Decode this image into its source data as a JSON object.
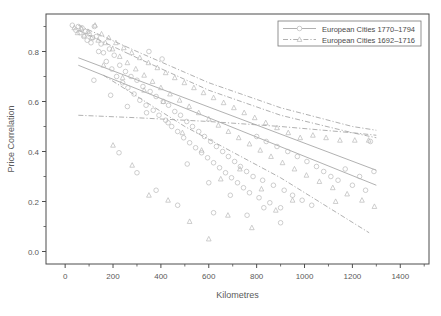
{
  "chart_data": {
    "type": "scatter",
    "title": "",
    "xlabel": "Kilometres",
    "ylabel": "Price Correlation",
    "xlim": [
      -80,
      1520
    ],
    "ylim": [
      -0.05,
      0.95
    ],
    "xticks": [
      0,
      200,
      400,
      600,
      800,
      1000,
      1200,
      1400
    ],
    "xtick_labels": [
      "0",
      "200",
      "400",
      "600",
      "800",
      "1000",
      "1200",
      "1400"
    ],
    "yticks": [
      0.0,
      0.2,
      0.4,
      0.6,
      0.8
    ],
    "ytick_labels": [
      "0.0",
      "0.2",
      "0.4",
      "0.6",
      "0.8"
    ],
    "minor_ticks": true,
    "grid": false,
    "legend_position": "top-right",
    "marker_color": "#b9b9b9",
    "line_color": "#a8a8a8",
    "frame_color": "#4d4d4d",
    "series": [
      {
        "name": "European Cities 1770–1794",
        "marker": "circle",
        "linestyle": "solid",
        "points": [
          [
            30,
            0.905
          ],
          [
            45,
            0.885
          ],
          [
            55,
            0.9
          ],
          [
            62,
            0.875
          ],
          [
            70,
            0.895
          ],
          [
            78,
            0.86
          ],
          [
            85,
            0.88
          ],
          [
            92,
            0.845
          ],
          [
            100,
            0.87
          ],
          [
            108,
            0.835
          ],
          [
            115,
            0.855
          ],
          [
            122,
            0.9
          ],
          [
            130,
            0.86
          ],
          [
            140,
            0.8
          ],
          [
            150,
            0.83
          ],
          [
            160,
            0.795
          ],
          [
            172,
            0.76
          ],
          [
            185,
            0.81
          ],
          [
            195,
            0.73
          ],
          [
            205,
            0.785
          ],
          [
            215,
            0.7
          ],
          [
            228,
            0.745
          ],
          [
            240,
            0.675
          ],
          [
            252,
            0.72
          ],
          [
            262,
            0.655
          ],
          [
            275,
            0.7
          ],
          [
            288,
            0.63
          ],
          [
            300,
            0.685
          ],
          [
            312,
            0.605
          ],
          [
            325,
            0.66
          ],
          [
            338,
            0.585
          ],
          [
            350,
            0.8
          ],
          [
            355,
            0.64
          ],
          [
            368,
            0.565
          ],
          [
            380,
            0.62
          ],
          [
            392,
            0.545
          ],
          [
            405,
            0.77
          ],
          [
            410,
            0.6
          ],
          [
            420,
            0.525
          ],
          [
            432,
            0.585
          ],
          [
            445,
            0.5
          ],
          [
            458,
            0.56
          ],
          [
            470,
            0.48
          ],
          [
            482,
            0.545
          ],
          [
            495,
            0.455
          ],
          [
            508,
            0.52
          ],
          [
            520,
            0.435
          ],
          [
            532,
            0.5
          ],
          [
            545,
            0.415
          ],
          [
            558,
            0.48
          ],
          [
            570,
            0.395
          ],
          [
            582,
            0.46
          ],
          [
            595,
            0.375
          ],
          [
            608,
            0.44
          ],
          [
            620,
            0.355
          ],
          [
            632,
            0.42
          ],
          [
            645,
            0.335
          ],
          [
            658,
            0.4
          ],
          [
            670,
            0.315
          ],
          [
            682,
            0.38
          ],
          [
            695,
            0.295
          ],
          [
            708,
            0.36
          ],
          [
            720,
            0.275
          ],
          [
            732,
            0.34
          ],
          [
            745,
            0.255
          ],
          [
            758,
            0.32
          ],
          [
            770,
            0.235
          ],
          [
            785,
            0.3
          ],
          [
            800,
            0.46
          ],
          [
            810,
            0.215
          ],
          [
            825,
            0.285
          ],
          [
            840,
            0.44
          ],
          [
            855,
            0.195
          ],
          [
            870,
            0.265
          ],
          [
            885,
            0.42
          ],
          [
            900,
            0.175
          ],
          [
            915,
            0.245
          ],
          [
            930,
            0.4
          ],
          [
            950,
            0.225
          ],
          [
            970,
            0.38
          ],
          [
            990,
            0.205
          ],
          [
            1010,
            0.36
          ],
          [
            1030,
            0.185
          ],
          [
            1050,
            0.34
          ],
          [
            1080,
            0.32
          ],
          [
            1110,
            0.3
          ],
          [
            1140,
            0.285
          ],
          [
            1170,
            0.33
          ],
          [
            1200,
            0.265
          ],
          [
            1230,
            0.3
          ],
          [
            1255,
            0.245
          ],
          [
            1275,
            0.44
          ],
          [
            1290,
            0.32
          ],
          [
            120,
            0.685
          ],
          [
            190,
            0.625
          ],
          [
            260,
            0.58
          ],
          [
            340,
            0.555
          ],
          [
            430,
            0.515
          ],
          [
            510,
            0.35
          ],
          [
            600,
            0.275
          ],
          [
            690,
            0.225
          ],
          [
            760,
            0.145
          ],
          [
            830,
            0.175
          ],
          [
            900,
            0.115
          ],
          [
            620,
            0.155
          ],
          [
            470,
            0.185
          ],
          [
            380,
            0.245
          ],
          [
            300,
            0.315
          ],
          [
            225,
            0.395
          ]
        ]
      },
      {
        "name": "European Cities 1692–1716",
        "marker": "triangle",
        "linestyle": "dashdot",
        "points": [
          [
            38,
            0.895
          ],
          [
            52,
            0.875
          ],
          [
            68,
            0.89
          ],
          [
            80,
            0.865
          ],
          [
            95,
            0.88
          ],
          [
            110,
            0.855
          ],
          [
            125,
            0.905
          ],
          [
            138,
            0.845
          ],
          [
            152,
            0.87
          ],
          [
            168,
            0.835
          ],
          [
            182,
            0.855
          ],
          [
            198,
            0.81
          ],
          [
            212,
            0.835
          ],
          [
            228,
            0.78
          ],
          [
            245,
            0.815
          ],
          [
            260,
            0.755
          ],
          [
            278,
            0.795
          ],
          [
            295,
            0.73
          ],
          [
            312,
            0.775
          ],
          [
            330,
            0.705
          ],
          [
            348,
            0.755
          ],
          [
            365,
            0.68
          ],
          [
            385,
            0.735
          ],
          [
            400,
            0.655
          ],
          [
            420,
            0.715
          ],
          [
            438,
            0.63
          ],
          [
            458,
            0.695
          ],
          [
            478,
            0.605
          ],
          [
            498,
            0.675
          ],
          [
            518,
            0.58
          ],
          [
            538,
            0.655
          ],
          [
            558,
            0.555
          ],
          [
            578,
            0.635
          ],
          [
            600,
            0.53
          ],
          [
            620,
            0.615
          ],
          [
            640,
            0.505
          ],
          [
            662,
            0.595
          ],
          [
            682,
            0.48
          ],
          [
            705,
            0.575
          ],
          [
            725,
            0.455
          ],
          [
            748,
            0.555
          ],
          [
            770,
            0.43
          ],
          [
            792,
            0.535
          ],
          [
            815,
            0.405
          ],
          [
            838,
            0.515
          ],
          [
            860,
            0.38
          ],
          [
            885,
            0.495
          ],
          [
            908,
            0.355
          ],
          [
            932,
            0.475
          ],
          [
            958,
            0.33
          ],
          [
            982,
            0.455
          ],
          [
            1008,
            0.305
          ],
          [
            1035,
            0.465
          ],
          [
            1062,
            0.28
          ],
          [
            1090,
            0.455
          ],
          [
            1118,
            0.255
          ],
          [
            1148,
            0.445
          ],
          [
            1178,
            0.23
          ],
          [
            1210,
            0.445
          ],
          [
            1240,
            0.205
          ],
          [
            1268,
            0.445
          ],
          [
            1292,
            0.18
          ],
          [
            160,
            0.745
          ],
          [
            240,
            0.695
          ],
          [
            330,
            0.645
          ],
          [
            410,
            0.6
          ],
          [
            490,
            0.475
          ],
          [
            570,
            0.405
          ],
          [
            650,
            0.29
          ],
          [
            730,
            0.33
          ],
          [
            820,
            0.25
          ],
          [
            430,
            0.205
          ],
          [
            520,
            0.12
          ],
          [
            350,
            0.225
          ],
          [
            600,
            0.05
          ],
          [
            680,
            0.145
          ],
          [
            780,
            0.095
          ],
          [
            880,
            0.165
          ],
          [
            280,
            0.345
          ],
          [
            200,
            0.425
          ],
          [
            1130,
            0.2
          ],
          [
            950,
            0.205
          ]
        ]
      }
    ],
    "fit_lines": [
      {
        "name": "fit-1770-1794",
        "style": "solid",
        "points": [
          [
            55,
            0.745
          ],
          [
            1300,
            0.265
          ]
        ]
      },
      {
        "name": "fit-1692-1716",
        "style": "dashdot",
        "points": [
          [
            55,
            0.885
          ],
          [
            300,
            0.775
          ],
          [
            600,
            0.645
          ],
          [
            900,
            0.545
          ],
          [
            1200,
            0.475
          ],
          [
            1300,
            0.455
          ]
        ]
      },
      {
        "name": "ci-upper-1692-1716",
        "style": "dashdot",
        "points": [
          [
            55,
            0.905
          ],
          [
            300,
            0.8
          ],
          [
            600,
            0.675
          ],
          [
            900,
            0.575
          ],
          [
            1200,
            0.5
          ],
          [
            1300,
            0.485
          ]
        ]
      },
      {
        "name": "ci-lower-flat",
        "style": "dashdot",
        "points": [
          [
            55,
            0.545
          ],
          [
            300,
            0.535
          ],
          [
            600,
            0.52
          ],
          [
            900,
            0.5
          ],
          [
            1200,
            0.475
          ],
          [
            1300,
            0.465
          ]
        ]
      },
      {
        "name": "ci-upper-1770-1794",
        "style": "solid",
        "points": [
          [
            55,
            0.775
          ],
          [
            1300,
            0.325
          ]
        ]
      },
      {
        "name": "ci-lower-1770-1794",
        "style": "dashdot",
        "points": [
          [
            160,
            0.705
          ],
          [
            500,
            0.5
          ],
          [
            900,
            0.295
          ],
          [
            1270,
            0.075
          ]
        ]
      }
    ]
  }
}
